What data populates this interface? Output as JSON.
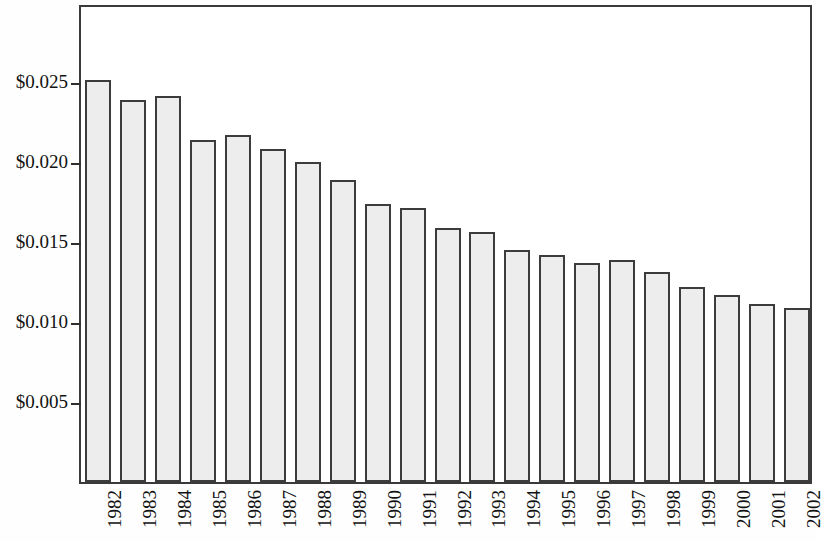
{
  "chart_data": {
    "type": "bar",
    "title": "",
    "subtitle": "",
    "xlabel": "",
    "ylabel": "",
    "categories": [
      "1982",
      "1983",
      "1984",
      "1985",
      "1986",
      "1987",
      "1988",
      "1989",
      "1990",
      "1991",
      "1992",
      "1993",
      "1994",
      "1995",
      "1996",
      "1997",
      "1998",
      "1999",
      "2000",
      "2001",
      "2002"
    ],
    "values": [
      0.0251,
      0.0239,
      0.0241,
      0.0214,
      0.0217,
      0.0208,
      0.02,
      0.0189,
      0.0174,
      0.0171,
      0.0159,
      0.0156,
      0.0145,
      0.0142,
      0.0137,
      0.0139,
      0.0131,
      0.0122,
      0.0117,
      0.0111,
      0.0109
    ],
    "ylim": [
      0,
      0.02994
    ],
    "ytick_values": [
      0.005,
      0.01,
      0.015,
      0.02,
      0.025
    ],
    "ytick_labels": [
      "$0.005",
      "$0.010",
      "$0.015",
      "$0.020",
      "$0.025"
    ],
    "grid": false,
    "legend": null,
    "bar_fill_color": "#ededed",
    "bar_edge_color": "#3c3c3c",
    "axis_color": "#3a3a3a",
    "background_color": "#ffffff"
  }
}
